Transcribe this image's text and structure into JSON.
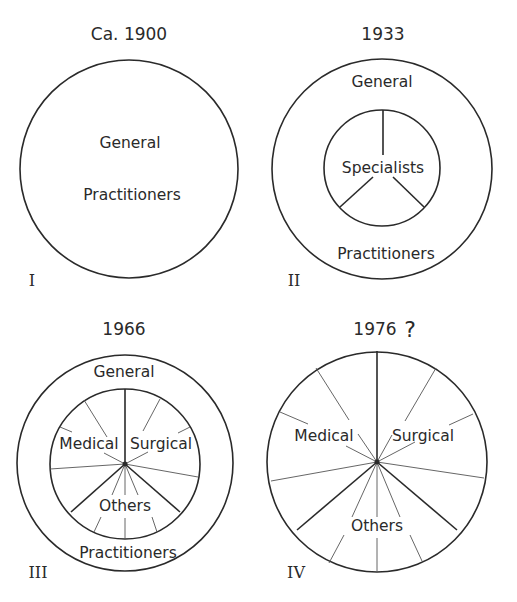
{
  "diagram": {
    "panels": [
      {
        "numeral": "I",
        "year": "Ca. 1900",
        "labels": {
          "general": "General",
          "practitioners": "Practitioners"
        }
      },
      {
        "numeral": "II",
        "year": "1933",
        "labels": {
          "general": "General",
          "specialists": "Specialists",
          "practitioners": "Practitioners"
        }
      },
      {
        "numeral": "III",
        "year": "1966",
        "labels": {
          "general": "General",
          "medical": "Medical",
          "surgical": "Surgical",
          "others": "Others",
          "practitioners": "Practitioners"
        }
      },
      {
        "numeral": "IV",
        "year": "1976",
        "question_mark": "?",
        "labels": {
          "medical": "Medical",
          "surgical": "Surgical",
          "others": "Others"
        }
      }
    ]
  }
}
